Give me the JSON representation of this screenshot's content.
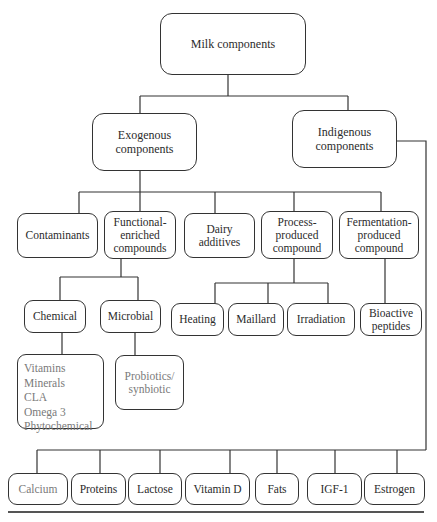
{
  "diagram": {
    "root": {
      "label": "Milk components"
    },
    "level1": {
      "exogenous": {
        "label": "Exogenous\ncomponents"
      },
      "indigenous": {
        "label": "Indigenous\ncomponents"
      }
    },
    "exogenous_children": {
      "contaminants": {
        "label": "Contaminants"
      },
      "functional": {
        "label": "Functional-\nenriched\ncompounds"
      },
      "dairy": {
        "label": "Dairy\nadditives"
      },
      "process": {
        "label": "Process-\nproduced\ncompound"
      },
      "fermentation": {
        "label": "Fermentation-\nproduced\ncompound"
      }
    },
    "functional_children": {
      "chemical": {
        "label": "Chemical"
      },
      "microbial": {
        "label": "Microbial"
      }
    },
    "chemical_items": {
      "label": "Vitamins\nMinerals\nCLA\nOmega 3\nPhytochemical"
    },
    "microbial_items": {
      "label": "Probiotics/\nsynbiotic"
    },
    "process_children": {
      "heating": {
        "label": "Heating"
      },
      "maillard": {
        "label": "Maillard"
      },
      "irradiation": {
        "label": "Irradiation"
      }
    },
    "fermentation_children": {
      "bioactive": {
        "label": "Bioactive\npeptides"
      }
    },
    "indigenous_children": [
      {
        "label": "Calcium"
      },
      {
        "label": "Proteins"
      },
      {
        "label": "Lactose"
      },
      {
        "label": "Vitamin D"
      },
      {
        "label": "Fats"
      },
      {
        "label": "IGF-1"
      },
      {
        "label": "Estrogen"
      }
    ],
    "colors": {
      "line": "#333333",
      "gray_text": "#7a7a7a"
    }
  }
}
